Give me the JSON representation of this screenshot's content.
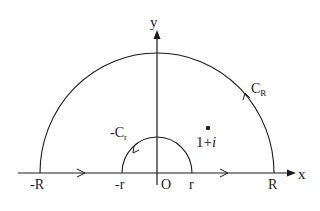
{
  "diagram": {
    "axes": {
      "x_label": "x",
      "y_label": "y",
      "origin_label": "O"
    },
    "tick_labels": {
      "neg_R": "-R",
      "neg_r": "-r",
      "r": "r",
      "R": "R"
    },
    "contours": {
      "outer_arc_label_main": "C",
      "outer_arc_label_sub": "R",
      "inner_arc_label_main": "-C",
      "inner_arc_label_sub": "r"
    },
    "point": {
      "label_real": "1+",
      "label_imag": "i"
    },
    "colors": {
      "stroke": "#1a1a1a",
      "background": "#ffffff"
    }
  }
}
